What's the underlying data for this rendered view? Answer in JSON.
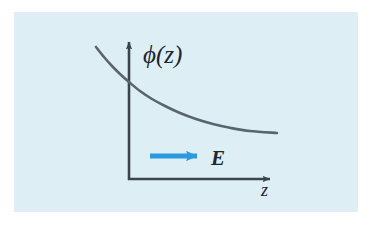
{
  "figure": {
    "caption_type": "physics-diagram",
    "background_color": "#ffffff",
    "panel_color": "#ddeff5",
    "axis_color": "#3a444e",
    "curve_color": "#5a6470",
    "arrow_color": "#2b9ae0",
    "label_color": "#20262e"
  },
  "labels": {
    "y_axis": "ϕ(z)",
    "x_axis": "z",
    "field_arrow": "E"
  },
  "icons": {
    "y_axis_arrowhead": "arrow-up-icon",
    "x_axis_arrowhead": "arrow-right-icon",
    "field_arrowhead": "arrow-right-icon"
  },
  "chart_data": {
    "type": "line",
    "title": "",
    "xlabel": "z",
    "ylabel": "ϕ(z)",
    "legend": [],
    "grid": false,
    "axis_arrows": true,
    "origin_px": [
      129,
      179
    ],
    "xlim_px": [
      96,
      277
    ],
    "ylim_px": [
      47,
      179
    ],
    "annotations": [
      {
        "text": "E",
        "type": "arrow",
        "direction": "right",
        "color": "#2b9ae0",
        "x_start_px": 150,
        "x_end_px": 203,
        "y_px": 156,
        "label_x_px": 212,
        "label_y_px": 163
      }
    ],
    "series": [
      {
        "name": "ϕ(z)",
        "description": "monotonically decreasing convex potential, decaying toward a constant",
        "points_px": [
          [
            96,
            47
          ],
          [
            104,
            57
          ],
          [
            112,
            66
          ],
          [
            120,
            74
          ],
          [
            129,
            82
          ],
          [
            140,
            91
          ],
          [
            152,
            99
          ],
          [
            165,
            106
          ],
          [
            180,
            113
          ],
          [
            196,
            119
          ],
          [
            213,
            124
          ],
          [
            231,
            128
          ],
          [
            250,
            131
          ],
          [
            277,
            133
          ]
        ]
      }
    ]
  }
}
